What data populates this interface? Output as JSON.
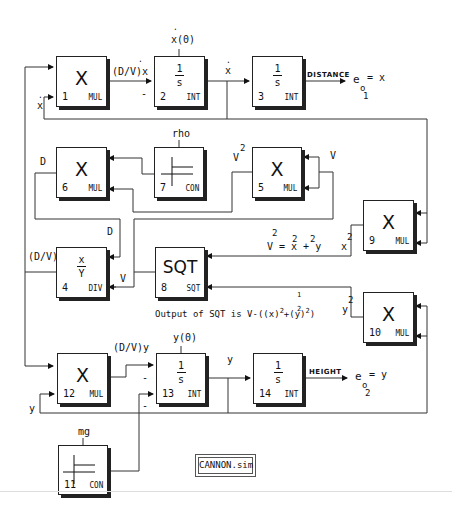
{
  "diagram": {
    "title": "CANNON.sim",
    "blocks": [
      {
        "id": 1,
        "number": "1",
        "type": "MUL",
        "symbol": "X"
      },
      {
        "id": 2,
        "number": "2",
        "type": "INT",
        "numerator": "1",
        "denominator": "s"
      },
      {
        "id": 3,
        "number": "3",
        "type": "INT",
        "numerator": "1",
        "denominator": "s"
      },
      {
        "id": 6,
        "number": "6",
        "type": "MUL",
        "symbol": "X"
      },
      {
        "id": 7,
        "number": "7",
        "type": "CON"
      },
      {
        "id": 5,
        "number": "5",
        "type": "MUL",
        "symbol": "X"
      },
      {
        "id": 9,
        "number": "9",
        "type": "MUL",
        "symbol": "X"
      },
      {
        "id": 4,
        "number": "4",
        "type": "DIV",
        "numerator": "x",
        "denominator": "Y"
      },
      {
        "id": 8,
        "number": "8",
        "type": "SQT",
        "symbol": "SQT"
      },
      {
        "id": 10,
        "number": "10",
        "type": "MUL",
        "symbol": "X"
      },
      {
        "id": 12,
        "number": "12",
        "type": "MUL",
        "symbol": "X"
      },
      {
        "id": 13,
        "number": "13",
        "type": "INT",
        "numerator": "1",
        "denominator": "s"
      },
      {
        "id": 14,
        "number": "14",
        "type": "INT",
        "numerator": "1",
        "denominator": "s"
      },
      {
        "id": 11,
        "number": "11",
        "type": "CON"
      }
    ],
    "labels": {
      "dv_xdot": "(D/V)x",
      "x0": "x(0)",
      "xdot_out2": "x",
      "xdot_fb1": "x",
      "minus_2": "-",
      "distance": "DISTANCE",
      "eo1": "e",
      "eo1_sub": "o",
      "eo1_sub2": "1",
      "eo1_rhs": "= x",
      "rho": "rho",
      "v2_label": "V",
      "v2_sup": "2",
      "v_label_5": "V",
      "d_label_6": "D",
      "d_label_4": "D",
      "dv_label_4": "(D/V)",
      "v_label_8": "V",
      "v2_eq_sup": "2",
      "v2_eq": "V = x + y",
      "v2_eq_sup_x": "2",
      "v2_eq_sup_y": "2",
      "xdot2_9": "x",
      "xdot2_9_sup": "2",
      "ydot2_10": "y",
      "ydot2_10_sup": "2",
      "sqt_output": "Output of SQT is V-((x)",
      "sqt_output_mid": "+(y)",
      "sqt_output_end": ")",
      "sqt_half_num": "1",
      "sqt_half_den": "2",
      "sqt_sup_2a": "2",
      "sqt_sup_2b": "2",
      "dv_ydot": "(D/V)y",
      "y0": "y(0)",
      "ydot_out13": "y",
      "ydot_fb12": "y",
      "minus_13a": "-",
      "minus_13b": "-",
      "height": "HEIGHT",
      "eo2": "e",
      "eo2_sub": "o",
      "eo2_sub2": "2",
      "eo2_rhs": "= y",
      "mg": "mg"
    }
  }
}
